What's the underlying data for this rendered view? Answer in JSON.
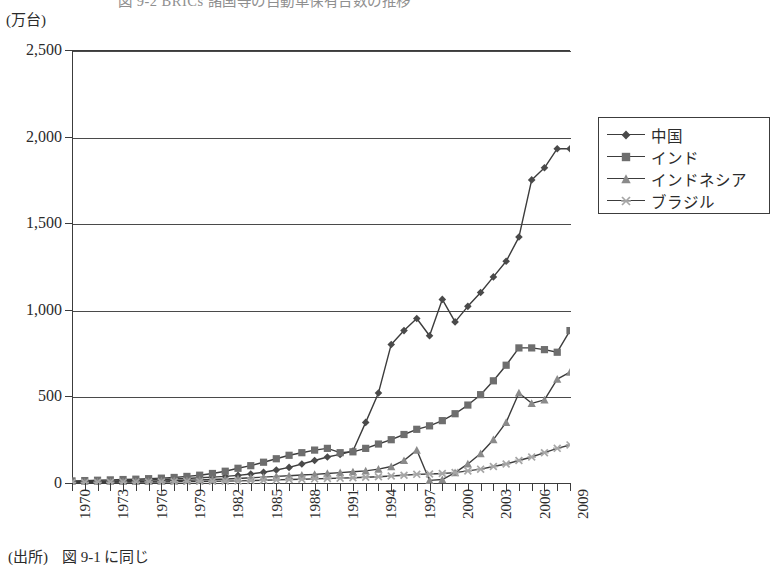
{
  "figure": {
    "clipped_title": "図 9-2 BRICs 諸国等の自動車保有台数の推移",
    "unit_label": "(万台)",
    "source_prefix": "(出所)",
    "source_text": "図 9-1 に同じ"
  },
  "legend": {
    "position": "right",
    "entries": [
      {
        "label": "中国",
        "marker": "diamond",
        "color": "#4a4a4a"
      },
      {
        "label": "インド",
        "marker": "square",
        "color": "#6e6e6e"
      },
      {
        "label": "インドネシア",
        "marker": "triangle",
        "color": "#8a8a8a"
      },
      {
        "label": "ブラジル",
        "marker": "star",
        "color": "#a6a6a6"
      }
    ]
  },
  "axes": {
    "y_ticks": [
      "0",
      "500",
      "1,000",
      "1,500",
      "2,000",
      "2,500"
    ],
    "y_values": [
      0,
      500,
      1000,
      1500,
      2000,
      2500
    ],
    "x_tick_labels": [
      "1970",
      "1973",
      "1976",
      "1979",
      "1982",
      "1985",
      "1988",
      "1991",
      "1994",
      "1997",
      "2000",
      "2003",
      "2006",
      "2009"
    ],
    "x_label_years": [
      1970,
      1973,
      1976,
      1979,
      1982,
      1985,
      1988,
      1991,
      1994,
      1997,
      2000,
      2003,
      2006,
      2009
    ]
  },
  "chart_data": {
    "type": "line",
    "title": "図 9-2 BRICs 諸国等の自動車保有台数の推移",
    "xlabel": "",
    "ylabel": "(万台)",
    "ylim": [
      0,
      2500
    ],
    "xlim": [
      1970,
      2009
    ],
    "grid": true,
    "legend_position": "right",
    "x": [
      1970,
      1971,
      1972,
      1973,
      1974,
      1975,
      1976,
      1977,
      1978,
      1979,
      1980,
      1981,
      1982,
      1983,
      1984,
      1985,
      1986,
      1987,
      1988,
      1989,
      1990,
      1991,
      1992,
      1993,
      1994,
      1995,
      1996,
      1997,
      1998,
      1999,
      2000,
      2001,
      2002,
      2003,
      2004,
      2005,
      2006,
      2007,
      2008,
      2009
    ],
    "series": [
      {
        "name": "中国",
        "marker": "diamond",
        "color": "#4a4a4a",
        "values": [
          8,
          9,
          10,
          12,
          14,
          16,
          18,
          20,
          23,
          26,
          30,
          34,
          38,
          44,
          52,
          62,
          75,
          90,
          110,
          130,
          150,
          165,
          185,
          350,
          520,
          800,
          880,
          950,
          850,
          1060,
          930,
          1020,
          1100,
          1190,
          1280,
          1420,
          1750,
          1820,
          1930,
          1930
        ],
        "note": "series drawn from 1993 onward in the figure; earlier points sit on the baseline"
      },
      {
        "name": "インド",
        "marker": "square",
        "color": "#6e6e6e",
        "values": [
          12,
          14,
          16,
          18,
          20,
          22,
          25,
          28,
          32,
          38,
          45,
          55,
          68,
          85,
          100,
          120,
          140,
          160,
          175,
          190,
          200,
          175,
          180,
          200,
          225,
          250,
          280,
          310,
          330,
          360,
          400,
          450,
          510,
          590,
          680,
          780,
          780,
          770,
          755,
          880
        ]
      },
      {
        "name": "インドネシア",
        "marker": "triangle",
        "color": "#8a8a8a",
        "values": [
          4,
          5,
          6,
          7,
          8,
          9,
          10,
          12,
          14,
          16,
          18,
          20,
          23,
          26,
          30,
          34,
          38,
          42,
          46,
          50,
          55,
          60,
          65,
          70,
          80,
          95,
          130,
          190,
          15,
          20,
          60,
          110,
          170,
          250,
          350,
          520,
          460,
          480,
          600,
          640
        ]
      },
      {
        "name": "ブラジル",
        "marker": "star",
        "color": "#a6a6a6",
        "values": [
          3,
          3,
          4,
          4,
          5,
          5,
          6,
          6,
          7,
          8,
          9,
          10,
          11,
          12,
          14,
          16,
          18,
          20,
          22,
          24,
          26,
          28,
          30,
          33,
          36,
          40,
          45,
          50,
          52,
          55,
          60,
          70,
          80,
          95,
          110,
          130,
          150,
          175,
          200,
          220
        ]
      }
    ]
  }
}
